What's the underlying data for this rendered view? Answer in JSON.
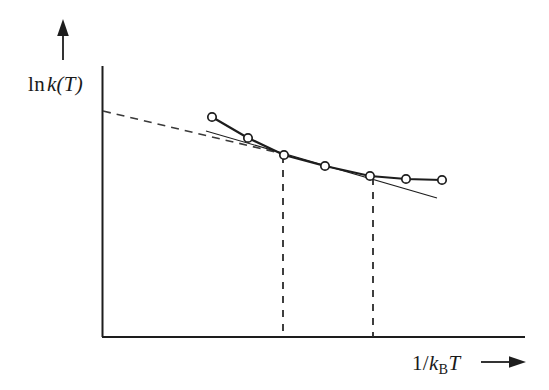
{
  "figure": {
    "title": "",
    "width": 549,
    "height": 390,
    "background_color": "#ffffff",
    "ink_color": "#1d1d1d"
  },
  "axes": {
    "y_label_prefix": "ln",
    "y_label_symbol": "k",
    "y_label_arg": "(T)",
    "y_label_full": "ln k(T)",
    "x_label_numerator": "1/",
    "x_label_symbol": "k",
    "x_label_subscript": "B",
    "x_label_variable": "T",
    "x_label_full": "1/kBT",
    "x_arrow_glyph": "arrow-right",
    "y_arrow_glyph": "arrow-up",
    "x_axis_y_px": 337,
    "y_axis_x_px": 102,
    "x_axis_start_px": 102,
    "x_axis_end_px": 525,
    "y_axis_top_px": 66,
    "y_axis_bottom_px": 337
  },
  "chart_data": {
    "type": "line",
    "title": "",
    "xlabel": "1/kBT",
    "ylabel": "ln k(T)",
    "grid": false,
    "legend": "none",
    "xlim": [
      102,
      525
    ],
    "ylim": [
      337,
      66
    ],
    "note": "Schematic Arrhenius plot: curvature of ln k(T) versus 1/kBT. Coordinates are in screenshot pixel space (y increases downward).",
    "series": [
      {
        "name": "data-curve",
        "style": "solid-thick-with-open-circle-markers",
        "marker": "open-circle",
        "marker_radius_px": 4.2,
        "line_width_px": 2.2,
        "color": "#1d1d1d",
        "points": [
          {
            "x": 212,
            "y": 117
          },
          {
            "x": 248,
            "y": 138
          },
          {
            "x": 284,
            "y": 155
          },
          {
            "x": 325,
            "y": 166
          },
          {
            "x": 370,
            "y": 176
          },
          {
            "x": 406,
            "y": 179
          },
          {
            "x": 442,
            "y": 180
          }
        ]
      },
      {
        "name": "tangent-line",
        "style": "solid-thin",
        "line_width_px": 1.1,
        "color": "#1d1d1d",
        "points": [
          {
            "x": 206,
            "y": 131
          },
          {
            "x": 437,
            "y": 198
          }
        ]
      },
      {
        "name": "extrapolation-dashed",
        "style": "dashed",
        "line_width_px": 1.6,
        "dash_pattern": "8,6",
        "color": "#3a3a3a",
        "points": [
          {
            "x": 103,
            "y": 111
          },
          {
            "x": 288,
            "y": 155
          }
        ]
      }
    ],
    "reference_lines": [
      {
        "name": "dashed-vertical-left",
        "orientation": "vertical",
        "x": 283,
        "y_top": 156,
        "y_bottom": 337,
        "dash_pattern": "7,7",
        "color": "#2a2a2a"
      },
      {
        "name": "dashed-vertical-right",
        "orientation": "vertical",
        "x": 373,
        "y_top": 178,
        "y_bottom": 337,
        "dash_pattern": "7,7",
        "color": "#2a2a2a"
      }
    ]
  }
}
